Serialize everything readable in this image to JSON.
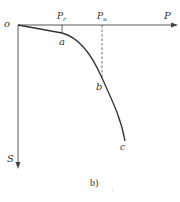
{
  "figure": {
    "caption": "b)",
    "stray_mark": "'",
    "colors": {
      "line": "#333333",
      "background": "#ffffff"
    }
  },
  "axes": {
    "origin_label": "o",
    "x_axis_label": "P",
    "y_axis_label": "S"
  },
  "markers": {
    "p_r": {
      "main": "P",
      "sub": "r"
    },
    "p_u": {
      "main": "P",
      "sub": "u"
    }
  },
  "points": {
    "a": "a",
    "b": "b",
    "c": "c"
  }
}
